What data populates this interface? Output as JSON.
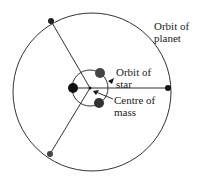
{
  "labels": {
    "orbit_planet": [
      "Orbit of",
      "planet"
    ],
    "orbit_star": [
      "Orbit of",
      "star"
    ],
    "centre_mass": [
      "Centre of",
      "mass"
    ]
  },
  "colors": {
    "line": "#333333",
    "star_dark": "#111111",
    "star_gray": "#444444"
  }
}
